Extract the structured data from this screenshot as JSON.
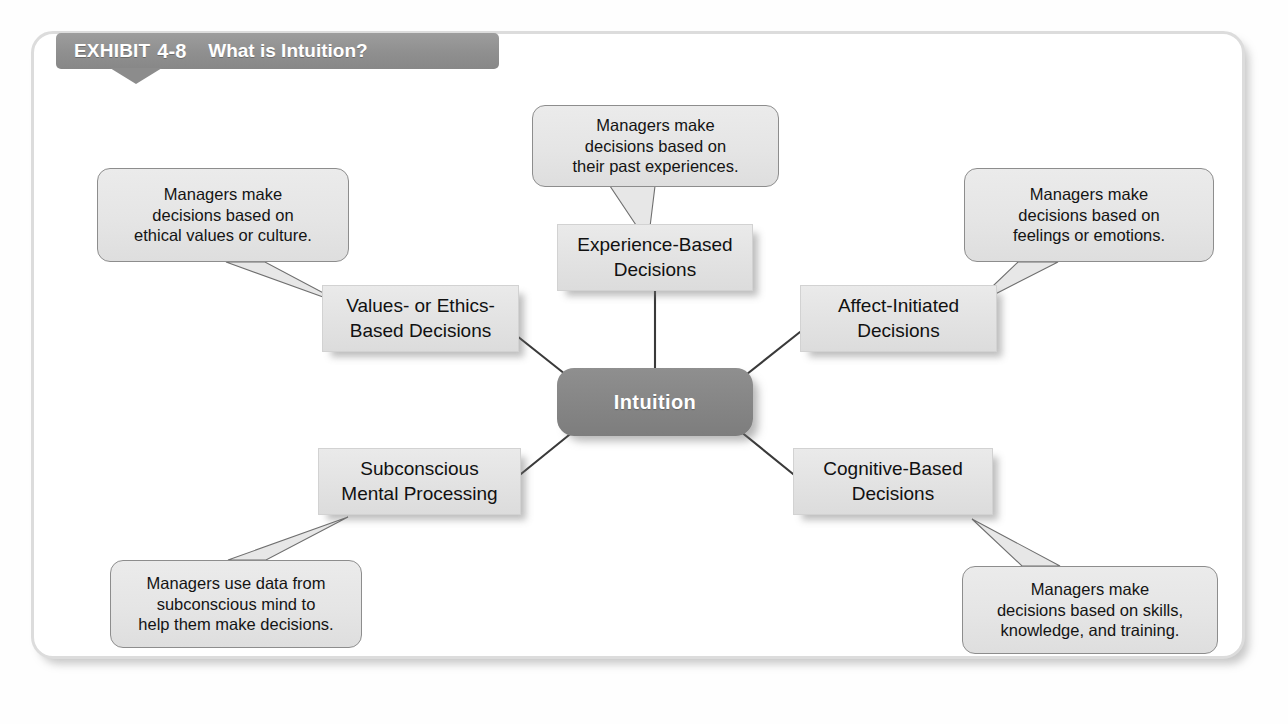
{
  "exhibit": {
    "label": "EXHIBIT",
    "number": "4-8",
    "title": "What is Intuition?"
  },
  "colors": {
    "frame_border": "#dcdcdc",
    "tab_gray": "#8f8f8f",
    "center_gray": "#858585",
    "node_gray": "#e3e3e3",
    "callout_gray": "#e5e5e5",
    "line_dark": "#3a3a3a",
    "text_dark": "#111111",
    "text_light": "#ffffff"
  },
  "center": {
    "label": "Intuition"
  },
  "nodes": [
    {
      "id": "experience-based",
      "label": "Experience-Based\nDecisions"
    },
    {
      "id": "values-ethics-based",
      "label": "Values- or Ethics-\nBased Decisions"
    },
    {
      "id": "affect-initiated",
      "label": "Affect-Initiated\nDecisions"
    },
    {
      "id": "subconscious",
      "label": "Subconscious\nMental Processing"
    },
    {
      "id": "cognitive-based",
      "label": "Cognitive-Based\nDecisions"
    }
  ],
  "callouts": [
    {
      "id": "experience",
      "text": "Managers make\ndecisions based on\ntheir past experiences."
    },
    {
      "id": "values",
      "text": "Managers make\ndecisions based on\nethical values or culture."
    },
    {
      "id": "affect",
      "text": "Managers make\ndecisions based on\nfeelings or emotions."
    },
    {
      "id": "subconscious",
      "text": "Managers use data from\nsubconscious mind to\nhelp them make decisions."
    },
    {
      "id": "cognitive",
      "text": "Managers make\ndecisions based on skills,\nknowledge, and training."
    }
  ],
  "chart_data": {
    "type": "diagram",
    "title": "What is Intuition?",
    "center": "Intuition",
    "nodes": [
      "Experience-Based Decisions",
      "Values- or Ethics-Based Decisions",
      "Affect-Initiated Decisions",
      "Subconscious Mental Processing",
      "Cognitive-Based Decisions"
    ],
    "annotations": [
      "Managers make decisions based on their past experiences.",
      "Managers make decisions based on ethical values or culture.",
      "Managers make decisions based on feelings or emotions.",
      "Managers use data from subconscious mind to help them make decisions.",
      "Managers make decisions based on skills, knowledge, and training."
    ]
  }
}
